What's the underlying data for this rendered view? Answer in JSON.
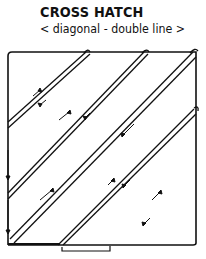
{
  "diagram": {
    "title": "CROSS HATCH",
    "subtitle": "< diagonal - double line >",
    "box": {
      "x1": 8,
      "y1": 52,
      "x2": 196,
      "y2": 245
    },
    "stroke_color": "#111111",
    "hatch_lines": [
      {
        "from": [
          8,
          124
        ],
        "to": [
          88,
          52
        ]
      },
      {
        "from": [
          8,
          196
        ],
        "to": [
          146,
          52
        ]
      },
      {
        "from": [
          10,
          241
        ],
        "to": [
          194,
          54
        ]
      },
      {
        "from": [
          60,
          245
        ],
        "to": [
          195,
          110
        ]
      }
    ],
    "footer_text_cropped": "..."
  }
}
